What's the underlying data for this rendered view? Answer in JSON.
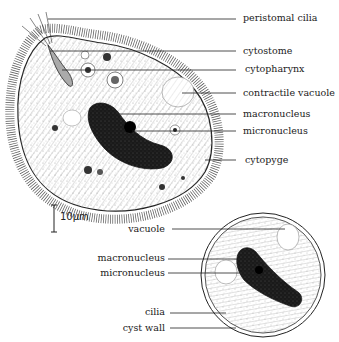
{
  "figure": {
    "type": "scientific-illustration",
    "colors": {
      "ink": "#222222",
      "background": "#ffffff",
      "nucleus": "#1a1a1a"
    }
  },
  "trophozoite_labels": [
    {
      "id": "peristomal-cilia",
      "text": "peristomal cilia"
    },
    {
      "id": "cytostome",
      "text": "cytostome"
    },
    {
      "id": "cytopharynx",
      "text": "cytopharynx"
    },
    {
      "id": "contractile-vacuole",
      "text": "contractile vacuole"
    },
    {
      "id": "macronucleus",
      "text": "macronucleus"
    },
    {
      "id": "micronucleus",
      "text": "micronucleus"
    },
    {
      "id": "cytopyge",
      "text": "cytopyge"
    }
  ],
  "cyst_labels": [
    {
      "id": "vacuole",
      "text": "vacuole"
    },
    {
      "id": "macronucleus",
      "text": "macronucleus"
    },
    {
      "id": "micronucleus",
      "text": "micronucleus"
    },
    {
      "id": "cilia",
      "text": "cilia"
    },
    {
      "id": "cyst-wall",
      "text": "cyst wall"
    }
  ],
  "scale_bar": {
    "text": "10μm"
  }
}
